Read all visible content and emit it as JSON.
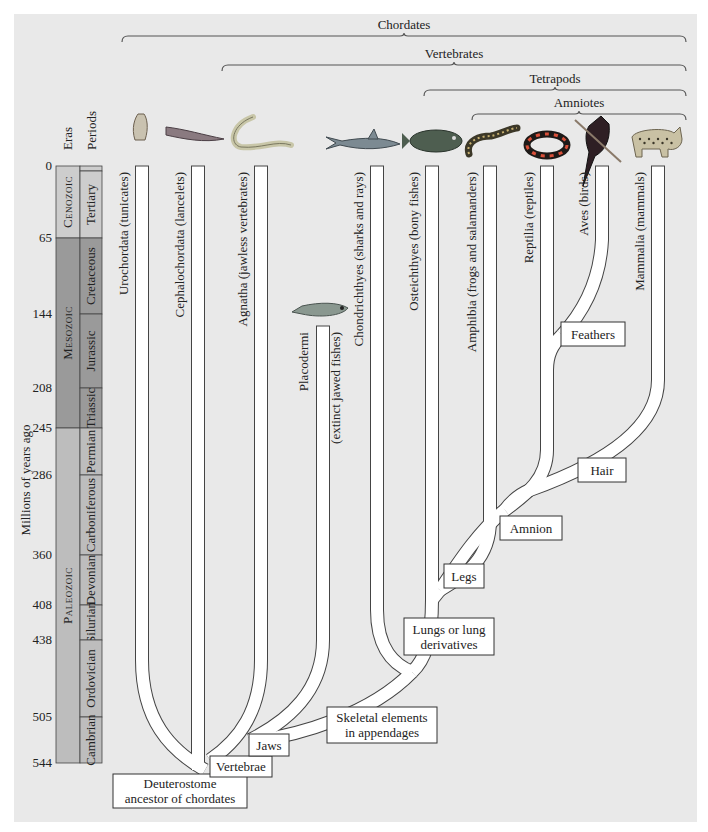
{
  "groups": [
    {
      "label": "Chordates",
      "x1": 122,
      "x2": 686,
      "y": 36
    },
    {
      "label": "Vertebrates",
      "x1": 222,
      "x2": 686,
      "y": 65
    },
    {
      "label": "Tetrapods",
      "x1": 424,
      "x2": 686,
      "y": 90
    },
    {
      "label": "Amniotes",
      "x1": 472,
      "x2": 686,
      "y": 114
    }
  ],
  "timescale": {
    "axis_label": "Millions of years ago",
    "eras_header": "Eras",
    "periods_header": "Periods",
    "ticks": [
      {
        "label": "0",
        "y": 166
      },
      {
        "label": "65",
        "y": 238
      },
      {
        "label": "144",
        "y": 314
      },
      {
        "label": "208",
        "y": 388
      },
      {
        "label": "245",
        "y": 428
      },
      {
        "label": "286",
        "y": 475
      },
      {
        "label": "360",
        "y": 555
      },
      {
        "label": "408",
        "y": 605
      },
      {
        "label": "438",
        "y": 640
      },
      {
        "label": "505",
        "y": 717
      },
      {
        "label": "544",
        "y": 763
      }
    ],
    "eras": [
      {
        "label": "Cenozoic",
        "top": 166,
        "bottom": 238,
        "color": "#cdcdcd"
      },
      {
        "label": "Mesozoic",
        "top": 238,
        "bottom": 428,
        "color": "#9a9a9a"
      },
      {
        "label": "Paleozoic",
        "top": 428,
        "bottom": 763,
        "color": "#bdbdbd"
      }
    ],
    "periods": [
      {
        "label": "",
        "top": 166,
        "bottom": 171,
        "color": "#cdcdcd"
      },
      {
        "label": "Tertiary",
        "top": 171,
        "bottom": 238,
        "color": "#cdcdcd"
      },
      {
        "label": "Cretaceous",
        "top": 238,
        "bottom": 314,
        "color": "#9a9a9a"
      },
      {
        "label": "Jurassic",
        "top": 314,
        "bottom": 388,
        "color": "#9a9a9a"
      },
      {
        "label": "Triassic",
        "top": 388,
        "bottom": 428,
        "color": "#9a9a9a"
      },
      {
        "label": "Permian",
        "top": 428,
        "bottom": 475,
        "color": "#bdbdbd"
      },
      {
        "label": "Carboniferous",
        "top": 475,
        "bottom": 555,
        "color": "#bdbdbd"
      },
      {
        "label": "Devonian",
        "top": 555,
        "bottom": 605,
        "color": "#bdbdbd"
      },
      {
        "label": "Silurian",
        "top": 605,
        "bottom": 640,
        "color": "#bdbdbd"
      },
      {
        "label": "Ordovician",
        "top": 640,
        "bottom": 717,
        "color": "#bdbdbd"
      },
      {
        "label": "Cambrian",
        "top": 717,
        "bottom": 763,
        "color": "#bdbdbd"
      }
    ]
  },
  "taxa": [
    {
      "label": "Urochordata (tunicates)",
      "x": 142,
      "label_x": 128,
      "animal": "tunicate"
    },
    {
      "label": "Cephalochordata (lancelets)",
      "x": 198,
      "label_x": 184,
      "animal": "lancelet"
    },
    {
      "label": "Agnatha (jawless vertebrates)",
      "x": 261,
      "label_x": 247,
      "animal": "lamprey"
    },
    {
      "label": "Chondrichthyes (sharks and rays)",
      "x": 377,
      "label_x": 363,
      "animal": "shark"
    },
    {
      "label": "Osteichthyes (bony fishes)",
      "x": 432,
      "label_x": 418,
      "animal": "bony-fish"
    },
    {
      "label": "Amphibia (frogs and salamanders)",
      "x": 490,
      "label_x": 476,
      "animal": "salamander"
    },
    {
      "label": "Reptilia (reptiles)",
      "x": 547,
      "label_x": 533,
      "animal": "snake"
    },
    {
      "label": "Aves (birds)",
      "x": 602,
      "label_x": 588,
      "animal": "bird"
    },
    {
      "label": "Mammalia (mammals)",
      "x": 658,
      "label_x": 644,
      "animal": "cat"
    }
  ],
  "extinct": {
    "label_1": "Placodermi",
    "label_2": "(extinct jawed fishes)",
    "animal": "placoderm"
  },
  "characters": [
    {
      "label": [
        "Deuterostome",
        "ancestor of chordates"
      ],
      "x": 113,
      "y": 774,
      "w": 134,
      "h": 34
    },
    {
      "label": [
        "Vertebrae"
      ],
      "x": 210,
      "y": 756,
      "w": 62,
      "h": 21
    },
    {
      "label": [
        "Jaws"
      ],
      "x": 249,
      "y": 734,
      "w": 40,
      "h": 22
    },
    {
      "label": [
        "Skeletal elements",
        "in appendages"
      ],
      "x": 327,
      "y": 707,
      "w": 110,
      "h": 36
    },
    {
      "label": [
        "Lungs or lung",
        "derivatives"
      ],
      "x": 404,
      "y": 618,
      "w": 90,
      "h": 37
    },
    {
      "label": [
        "Legs"
      ],
      "x": 444,
      "y": 564,
      "w": 40,
      "h": 24
    },
    {
      "label": [
        "Amnion"
      ],
      "x": 500,
      "y": 516,
      "w": 62,
      "h": 24
    },
    {
      "label": [
        "Hair"
      ],
      "x": 578,
      "y": 458,
      "w": 48,
      "h": 24
    },
    {
      "label": [
        "Feathers"
      ],
      "x": 561,
      "y": 322,
      "w": 64,
      "h": 24
    }
  ],
  "colors": {
    "background": "#e9e9e9",
    "branch_fill": "#ffffff",
    "branch_outline": "#444444"
  }
}
